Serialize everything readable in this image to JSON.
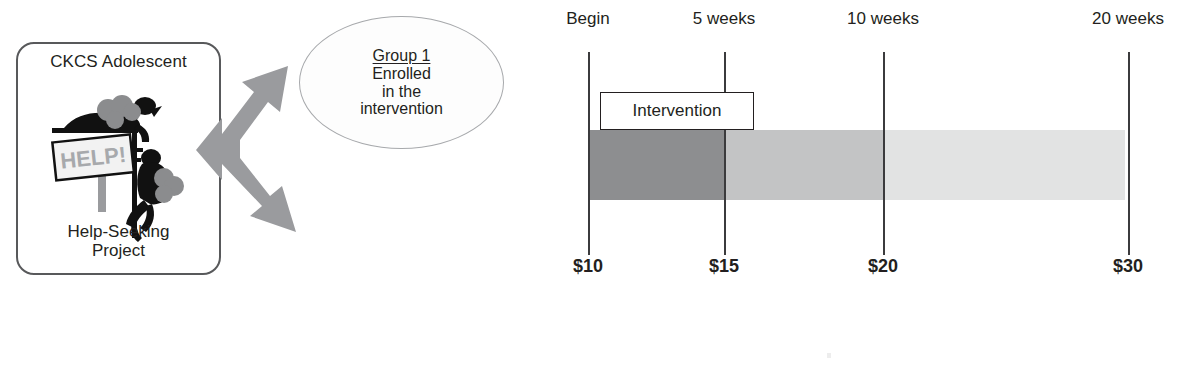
{
  "logo": {
    "title": "CKCS Adolescent",
    "subtitle_line1": "Help-Seeking",
    "subtitle_line2": "Project",
    "sign_text": "HELP!",
    "border_color": "#58595b"
  },
  "arrow": {
    "name": "three-way-arrow",
    "color": "#9a9b9e"
  },
  "callout": {
    "title": "Group 1",
    "body_line1": "Enrolled",
    "body_line2": "in the",
    "body_line3": "intervention",
    "border_color": "#a7a9ac"
  },
  "timeline": {
    "intervention_label": "Intervention",
    "ticks": [
      {
        "top_label": "Begin",
        "bottom_label": "$10",
        "x": 48
      },
      {
        "top_label": "5 weeks",
        "bottom_label": "$15",
        "x": 184
      },
      {
        "top_label": "10 weeks",
        "bottom_label": "$20",
        "x": 343
      },
      {
        "top_label": "20 weeks",
        "bottom_label": "$30",
        "x": 588
      }
    ],
    "segments": [
      {
        "name": "begin-to-5-weeks",
        "from_x": 48,
        "to_x": 184,
        "color": "#8d8e90"
      },
      {
        "name": "5-to-10-weeks",
        "from_x": 184,
        "to_x": 343,
        "color": "#c3c4c5"
      },
      {
        "name": "10-to-20-weeks",
        "from_x": 343,
        "to_x": 585,
        "color": "#e2e3e3"
      }
    ]
  }
}
